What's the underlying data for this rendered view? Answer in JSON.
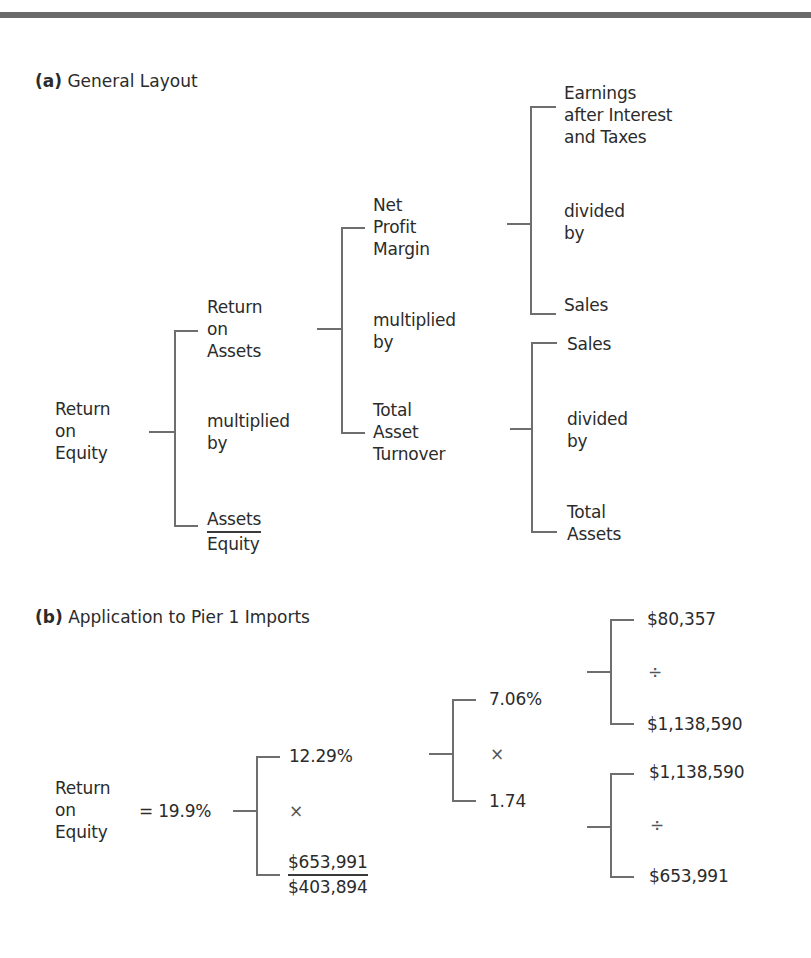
{
  "section_a": {
    "label": "(a)",
    "title": "General Layout",
    "root": "Return\non\nEquity",
    "level1": {
      "top": "Return\non\nAssets",
      "middle": "multiplied\nby",
      "bottom_numerator": "Assets",
      "bottom_denominator": "Equity"
    },
    "level2": {
      "top": "Net\nProfit\nMargin",
      "middle": "multiplied\nby",
      "bottom": "Total\nAsset\nTurnover"
    },
    "level3_upper": {
      "top": "Earnings\nafter Interest\nand Taxes",
      "middle": "divided\nby",
      "bottom": "Sales"
    },
    "level3_lower": {
      "top": "Sales",
      "middle": "divided\nby",
      "bottom": "Total\nAssets"
    }
  },
  "section_b": {
    "label": "(b)",
    "title": "Application to Pier 1 Imports",
    "root": "Return\non\nEquity",
    "root_value": "= 19.9%",
    "level1": {
      "top": "12.29%",
      "middle": "×",
      "bottom_numerator": "$653,991",
      "bottom_denominator": "$403,894"
    },
    "level2": {
      "top": "7.06%",
      "middle": "×",
      "bottom": "1.74"
    },
    "level3_upper": {
      "top": "$80,357",
      "middle": "÷",
      "bottom": "$1,138,590"
    },
    "level3_lower": {
      "top": "$1,138,590",
      "middle": "÷",
      "bottom": "$653,991"
    }
  },
  "colors": {
    "text": "#2b2b2b",
    "bracket": "#6e6e6e",
    "top_rule": "#6a6a6a"
  }
}
